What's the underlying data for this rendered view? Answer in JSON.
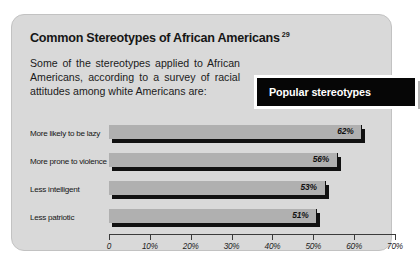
{
  "card": {
    "title": "Common Stereotypes of African Americans",
    "title_superscript": "29",
    "intro": "Some of the stereotypes applied to African Americans, according to a survey of racial attitudes among white Americans are:",
    "callout_label": "Popular stereotypes",
    "bg_color": "#d9d9d9",
    "callout_bg": "#060606",
    "callout_text_color": "#ffffff",
    "bar_color": "#b0b0b0",
    "bar_shadow_color": "#111111"
  },
  "chart_data": {
    "type": "bar",
    "orientation": "horizontal",
    "title": "Common Stereotypes of African Americans",
    "categories": [
      "More likely to be lazy",
      "More prone to violence",
      "Less intelligent",
      "Less patriotic"
    ],
    "values": [
      62,
      56,
      53,
      51
    ],
    "value_labels": [
      "62%",
      "56%",
      "53%",
      "51%"
    ],
    "xlabel": "",
    "ylabel": "",
    "xlim": [
      0,
      70
    ],
    "xticks": [
      0,
      10,
      20,
      30,
      40,
      50,
      60,
      70
    ],
    "xtick_labels": [
      "0",
      "10%",
      "20%",
      "30%",
      "40%",
      "50%",
      "60%",
      "70%"
    ],
    "grid": false,
    "legend": null,
    "series": [
      {
        "name": "Popular stereotypes",
        "values": [
          62,
          56,
          53,
          51
        ]
      }
    ]
  }
}
